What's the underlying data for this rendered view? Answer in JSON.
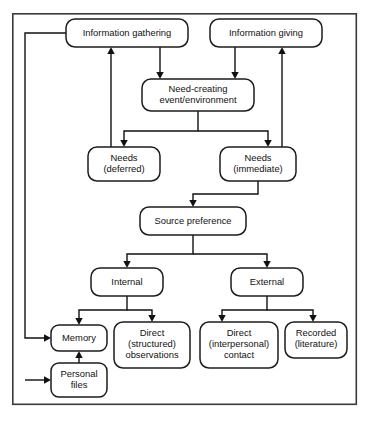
{
  "diagram": {
    "type": "flowchart",
    "colors": {
      "background": "#ffffff",
      "frame_stroke": "#3a3a3a",
      "node_stroke": "#1c1c1c",
      "node_fill": "#ffffff",
      "connector": "#111111",
      "text": "#111111"
    },
    "frame": {
      "x": 12,
      "y": 13,
      "width": 345,
      "height": 392
    },
    "nodes": [
      {
        "id": "information-gathering",
        "lines": [
          "Information gathering"
        ],
        "x": 66,
        "y": 19,
        "width": 122,
        "height": 28,
        "rx": 9
      },
      {
        "id": "information-giving",
        "lines": [
          "Information giving"
        ],
        "x": 210,
        "y": 19,
        "width": 112,
        "height": 28,
        "rx": 9
      },
      {
        "id": "need-creating-event-environment",
        "lines": [
          "Need-creating",
          "event/environment"
        ],
        "x": 142,
        "y": 79,
        "width": 112,
        "height": 32,
        "rx": 9
      },
      {
        "id": "needs-deferred",
        "lines": [
          "Needs",
          "(deferred)"
        ],
        "x": 88,
        "y": 147,
        "width": 72,
        "height": 34,
        "rx": 9
      },
      {
        "id": "needs-immediate",
        "lines": [
          "Needs",
          "(immediate)"
        ],
        "x": 220,
        "y": 147,
        "width": 76,
        "height": 34,
        "rx": 9
      },
      {
        "id": "source-preference",
        "lines": [
          "Source preference"
        ],
        "x": 140,
        "y": 207,
        "width": 106,
        "height": 28,
        "rx": 9
      },
      {
        "id": "internal",
        "lines": [
          "Internal"
        ],
        "x": 91,
        "y": 268,
        "width": 72,
        "height": 28,
        "rx": 9
      },
      {
        "id": "external",
        "lines": [
          "External"
        ],
        "x": 231,
        "y": 268,
        "width": 72,
        "height": 28,
        "rx": 9
      },
      {
        "id": "memory",
        "lines": [
          "Memory"
        ],
        "x": 51,
        "y": 325,
        "width": 56,
        "height": 26,
        "rx": 8
      },
      {
        "id": "direct-structured-observations",
        "lines": [
          "Direct",
          "(structured)",
          "observations"
        ],
        "x": 114,
        "y": 322,
        "width": 76,
        "height": 46,
        "rx": 9
      },
      {
        "id": "direct-interpersonal-contact",
        "lines": [
          "Direct",
          "(interpersonal)",
          "contact"
        ],
        "x": 200,
        "y": 322,
        "width": 78,
        "height": 46,
        "rx": 9
      },
      {
        "id": "recorded-literature",
        "lines": [
          "Recorded",
          "(literature)"
        ],
        "x": 285,
        "y": 322,
        "width": 62,
        "height": 36,
        "rx": 9
      },
      {
        "id": "personal-files",
        "lines": [
          "Personal",
          "files"
        ],
        "x": 51,
        "y": 363,
        "width": 56,
        "height": 34,
        "rx": 8
      }
    ],
    "edges": [
      {
        "id": "gathering-to-need",
        "from": "information-gathering",
        "to": "need-creating-event-environment",
        "arrow": true
      },
      {
        "id": "giving-to-need",
        "from": "information-giving",
        "to": "need-creating-event-environment",
        "arrow": true
      },
      {
        "id": "need-to-needs-deferred",
        "from": "need-creating-event-environment",
        "to": "needs-deferred",
        "arrow": true
      },
      {
        "id": "need-to-needs-immediate",
        "from": "need-creating-event-environment",
        "to": "needs-immediate",
        "arrow": true
      },
      {
        "id": "needs-deferred-to-gathering",
        "from": "needs-deferred",
        "to": "information-gathering",
        "arrow": true
      },
      {
        "id": "needs-immediate-to-giving",
        "from": "needs-immediate",
        "to": "information-giving",
        "arrow": true
      },
      {
        "id": "needs-immediate-to-source-preference",
        "from": "needs-immediate",
        "to": "source-preference",
        "arrow": true
      },
      {
        "id": "source-preference-to-internal",
        "from": "source-preference",
        "to": "internal",
        "arrow": true
      },
      {
        "id": "source-preference-to-external",
        "from": "source-preference",
        "to": "external",
        "arrow": true
      },
      {
        "id": "internal-to-memory",
        "from": "internal",
        "to": "memory",
        "arrow": true
      },
      {
        "id": "internal-to-direct-structured",
        "from": "internal",
        "to": "direct-structured-observations",
        "arrow": true
      },
      {
        "id": "external-to-direct-interpersonal",
        "from": "external",
        "to": "direct-interpersonal-contact",
        "arrow": true
      },
      {
        "id": "external-to-recorded",
        "from": "external",
        "to": "recorded-literature",
        "arrow": true
      },
      {
        "id": "personal-files-to-memory",
        "from": "personal-files",
        "to": "memory",
        "arrow": true
      },
      {
        "id": "gathering-to-memory",
        "from": "information-gathering",
        "to": "memory",
        "arrow": true
      },
      {
        "id": "gathering-to-personal-files",
        "from": "information-gathering",
        "to": "personal-files",
        "arrow": true
      }
    ]
  }
}
